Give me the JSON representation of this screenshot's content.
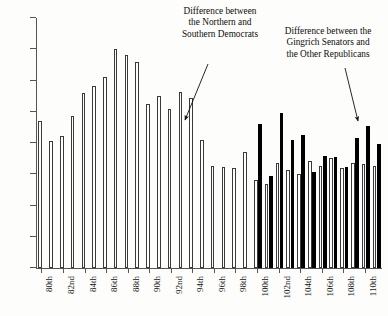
{
  "chart_data": {
    "type": "bar",
    "title": "",
    "xlabel": "",
    "ylabel": "",
    "ylim": [
      0,
      0.4
    ],
    "ytick_values": [
      0,
      0.05,
      0.1,
      0.15,
      0.2,
      0.25,
      0.3,
      0.35,
      0.4
    ],
    "ytick_labels": [
      "0",
      "0.05",
      "0.1",
      "0.15",
      "0.2",
      "0.25",
      "0.3",
      "0.35",
      "0.4"
    ],
    "grid": false,
    "legend_position": "none",
    "categories": [
      "80th",
      "81st",
      "82nd",
      "83rd",
      "84th",
      "85th",
      "86th",
      "87th",
      "88th",
      "89th",
      "90th",
      "91st",
      "92nd",
      "93rd",
      "94th",
      "95th",
      "96th",
      "97th",
      "98th",
      "99th",
      "100th",
      "101st",
      "102nd",
      "103rd",
      "104th",
      "105th",
      "106th",
      "107th",
      "108th",
      "109th",
      "110th",
      "111th"
    ],
    "xtick_labels": [
      "80th",
      "82nd",
      "84th",
      "86th",
      "88th",
      "90th",
      "92nd",
      "94th",
      "96th",
      "98th",
      "100th",
      "102nd",
      "104th",
      "106th",
      "108th",
      "110th"
    ],
    "xtick_categories": [
      "80th",
      "82nd",
      "84th",
      "86th",
      "88th",
      "90th",
      "92nd",
      "94th",
      "96th",
      "98th",
      "100th",
      "102nd",
      "104th",
      "106th",
      "108th",
      "110th"
    ],
    "series": [
      {
        "name": "Difference between the Northern and Southern Democrats",
        "style": "hollow",
        "color": "#ffffff",
        "edge_color": "#3a3a3a",
        "values": [
          0.235,
          0.204,
          0.212,
          0.244,
          0.28,
          0.292,
          0.305,
          0.351,
          0.341,
          0.329,
          0.263,
          0.275,
          0.255,
          0.281,
          0.272,
          0.205,
          0.164,
          0.162,
          0.16,
          0.186,
          0.141,
          0.135,
          0.168,
          0.157,
          0.15,
          0.172,
          0.164,
          0.176,
          0.16,
          0.168,
          0.166,
          0.163
        ]
      },
      {
        "name": "Difference between the Gingrich Senators and the Other Republicans",
        "style": "solid",
        "color": "#000000",
        "values": [
          null,
          null,
          null,
          null,
          null,
          null,
          null,
          null,
          null,
          null,
          null,
          null,
          null,
          null,
          null,
          null,
          null,
          null,
          null,
          null,
          0.231,
          0.148,
          0.248,
          0.205,
          0.213,
          0.153,
          0.18,
          0.178,
          0.162,
          0.208,
          0.227,
          0.198
        ]
      }
    ],
    "annotations": [
      {
        "id": "annotation-dem",
        "lines": [
          "Difference between",
          "the Northern and",
          "Southern Democrats"
        ],
        "arrow_from": [
          208,
          64
        ],
        "arrow_to": [
          185,
          120
        ]
      },
      {
        "id": "annotation-gop",
        "lines": [
          "Difference between the",
          "Gingrich Senators and",
          "the Other Republicans"
        ],
        "arrow_from": [
          345,
          68
        ],
        "arrow_to": [
          358,
          121
        ]
      }
    ]
  },
  "colors": {
    "dem_fill": "#ffffff",
    "dem_edge": "#3a3a3a",
    "gop_fill": "#000000",
    "axis": "#555555",
    "background": "#fdfdfb",
    "text": "#111111"
  }
}
